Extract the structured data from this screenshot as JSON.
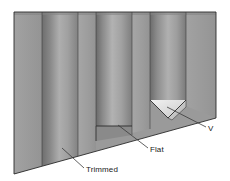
{
  "figure": {
    "type": "technical-illustration",
    "background_color": "#ffffff",
    "outline_color": "#2b2b2b",
    "labels": [
      {
        "id": "trimmed",
        "text": "Trimmed",
        "text_x": 86,
        "text_y": 172,
        "leader_from_x": 84,
        "leader_from_y": 168,
        "leader_to_x": 62,
        "leader_to_y": 148,
        "description": "points to the trimmed groove edge at lower left"
      },
      {
        "id": "flat",
        "text": "Flat",
        "text_x": 150,
        "text_y": 152,
        "leader_from_x": 148,
        "leader_from_y": 148,
        "leader_to_x": 118,
        "leader_to_y": 125,
        "description": "points to the flat-bottomed groove"
      },
      {
        "id": "v",
        "text": "V",
        "text_x": 208,
        "text_y": 131,
        "leader_from_x": 206,
        "leader_from_y": 127,
        "leader_to_x": 167,
        "leader_to_y": 107,
        "description": "points to the V-bottomed groove"
      }
    ],
    "colors": {
      "flat_face": "#9c9c9c",
      "flat_face_light": "#a8a8a8",
      "curve_dark": "#707070",
      "curve_mid": "#a5a5a5",
      "curve_light": "#b4b4b4",
      "groove_shadow": "#6e6e6e",
      "v_facet_light": "#e8e8e8",
      "v_facet_mid": "#cfcfcf",
      "top_edge": "#8d8d8d",
      "outline": "#2b2b2b"
    },
    "geometry_notes": {
      "top_edge_y": 12,
      "bottom_left_y": 174,
      "bottom_right_y": 118,
      "left_x": 14,
      "right_x": 216
    }
  }
}
